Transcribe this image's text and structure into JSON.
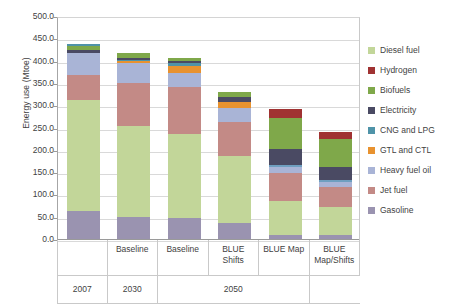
{
  "chart_data": {
    "type": "bar",
    "stacked": true,
    "title": "",
    "xlabel": "",
    "ylabel": "Energy use (Mtoe)",
    "ylim": [
      0,
      500
    ],
    "ytick_step": 50,
    "ytick_labels": [
      "500.0",
      "450.0",
      "400.0",
      "350.0",
      "300.0",
      "250.0",
      "200.0",
      "150.0",
      "100.0",
      "50.0",
      "0.0"
    ],
    "grid": true,
    "legend_position": "right",
    "categories": [
      "",
      "Baseline",
      "Baseline",
      "BLUE Shifts",
      "BLUE Map",
      "BLUE Map/Shifts"
    ],
    "category_labels_line1": [
      "",
      "Baseline",
      "Baseline",
      "BLUE",
      "BLUE Map",
      "BLUE"
    ],
    "category_labels_line2": [
      "",
      "",
      "",
      "Shifts",
      "",
      "Map/Shifts"
    ],
    "group_labels": [
      "2007",
      "2030",
      "2050"
    ],
    "group_spans": [
      1,
      1,
      3
    ],
    "series": [
      {
        "name": "Gasoline",
        "color": "#9a93b0",
        "values": [
          66.0,
          52.0,
          50.0,
          39.0,
          12.0,
          11.0
        ]
      },
      {
        "name": "Jet fuel",
        "color": "#c38a86",
        "values": [
          0.0,
          0.0,
          0.0,
          0.0,
          0.0,
          0.0
        ]
      },
      {
        "name": "Heavy fuel oil",
        "color": "#a9b4d6",
        "values": [
          0.0,
          0.0,
          0.0,
          0.0,
          0.0,
          0.0
        ]
      },
      {
        "name": "GTL and CTL",
        "color": "#e8922f",
        "values": [
          0.0,
          0.0,
          0.0,
          0.0,
          0.0,
          0.0
        ]
      },
      {
        "name": "CNG and LPG",
        "color": "#4f93a8",
        "values": [
          0.0,
          0.0,
          0.0,
          0.0,
          0.0,
          0.0
        ]
      },
      {
        "name": "Electricity",
        "color": "#4a4a63",
        "values": [
          0.0,
          0.0,
          0.0,
          0.0,
          0.0,
          0.0
        ]
      },
      {
        "name": "Biofuels",
        "color": "#7fa84a",
        "values": [
          0.0,
          0.0,
          0.0,
          0.0,
          0.0,
          0.0
        ]
      },
      {
        "name": "Hydrogen",
        "color": "#a03232",
        "values": [
          0.0,
          0.0,
          0.0,
          0.0,
          0.0,
          0.0
        ]
      },
      {
        "name": "Diesel fuel",
        "color": "#c2d699",
        "values": [
          0.0,
          0.0,
          0.0,
          0.0,
          0.0,
          0.0
        ]
      }
    ],
    "bars": [
      {
        "name": "2007",
        "total": 440.0,
        "segments": [
          {
            "series": "Gasoline",
            "value": 66.0,
            "color": "#9a93b0"
          },
          {
            "series": "Diesel fuel",
            "value": 249.0,
            "color": "#c2d699"
          },
          {
            "series": "Jet fuel",
            "value": 55.0,
            "color": "#c38a86"
          },
          {
            "series": "Heavy fuel oil",
            "value": 50.0,
            "color": "#a9b4d6"
          },
          {
            "series": "Electricity",
            "value": 7.0,
            "color": "#4a4a63"
          },
          {
            "series": "Biofuels",
            "value": 9.0,
            "color": "#7fa84a"
          },
          {
            "series": "CNG and LPG",
            "value": 4.0,
            "color": "#4f93a8"
          }
        ]
      },
      {
        "name": "2030 Baseline",
        "total": 420.0,
        "segments": [
          {
            "series": "Gasoline",
            "value": 52.0,
            "color": "#9a93b0"
          },
          {
            "series": "Diesel fuel",
            "value": 203.0,
            "color": "#c2d699"
          },
          {
            "series": "Jet fuel",
            "value": 96.0,
            "color": "#c38a86"
          },
          {
            "series": "Heavy fuel oil",
            "value": 45.0,
            "color": "#a9b4d6"
          },
          {
            "series": "GTL and CTL",
            "value": 5.0,
            "color": "#e8922f"
          },
          {
            "series": "CNG and LPG",
            "value": 3.0,
            "color": "#4f93a8"
          },
          {
            "series": "Electricity",
            "value": 4.0,
            "color": "#4a4a63"
          },
          {
            "series": "Biofuels",
            "value": 12.0,
            "color": "#7fa84a"
          }
        ]
      },
      {
        "name": "2050 Baseline",
        "total": 408.0,
        "segments": [
          {
            "series": "Gasoline",
            "value": 50.0,
            "color": "#9a93b0"
          },
          {
            "series": "Diesel fuel",
            "value": 187.0,
            "color": "#c2d699"
          },
          {
            "series": "Jet fuel",
            "value": 105.0,
            "color": "#c38a86"
          },
          {
            "series": "Heavy fuel oil",
            "value": 33.0,
            "color": "#a9b4d6"
          },
          {
            "series": "GTL and CTL",
            "value": 16.0,
            "color": "#e8922f"
          },
          {
            "series": "CNG and LPG",
            "value": 6.0,
            "color": "#4f93a8"
          },
          {
            "series": "Electricity",
            "value": 4.0,
            "color": "#4a4a63"
          },
          {
            "series": "Biofuels",
            "value": 7.0,
            "color": "#7fa84a"
          }
        ]
      },
      {
        "name": "2050 BLUE Shifts",
        "total": 333.0,
        "segments": [
          {
            "series": "Gasoline",
            "value": 39.0,
            "color": "#9a93b0"
          },
          {
            "series": "Diesel fuel",
            "value": 150.0,
            "color": "#c2d699"
          },
          {
            "series": "Jet fuel",
            "value": 75.0,
            "color": "#c38a86"
          },
          {
            "series": "Heavy fuel oil",
            "value": 33.0,
            "color": "#a9b4d6"
          },
          {
            "series": "GTL and CTL",
            "value": 13.0,
            "color": "#e8922f"
          },
          {
            "series": "Electricity",
            "value": 10.0,
            "color": "#4a4a63"
          },
          {
            "series": "Biofuels",
            "value": 13.0,
            "color": "#7fa84a"
          }
        ]
      },
      {
        "name": "2050 BLUE Map",
        "total": 293.0,
        "segments": [
          {
            "series": "Gasoline",
            "value": 12.0,
            "color": "#9a93b0"
          },
          {
            "series": "Diesel fuel",
            "value": 76.0,
            "color": "#c2d699"
          },
          {
            "series": "Jet fuel",
            "value": 62.0,
            "color": "#c38a86"
          },
          {
            "series": "Heavy fuel oil",
            "value": 13.0,
            "color": "#a9b4d6"
          },
          {
            "series": "CNG and LPG",
            "value": 6.0,
            "color": "#6f9fc0"
          },
          {
            "series": "Electricity",
            "value": 35.0,
            "color": "#4a4a63"
          },
          {
            "series": "Biofuels",
            "value": 69.0,
            "color": "#7fa84a"
          },
          {
            "series": "Hydrogen",
            "value": 20.0,
            "color": "#a03232"
          }
        ]
      },
      {
        "name": "2050 BLUE Map/Shifts",
        "total": 243.0,
        "segments": [
          {
            "series": "Gasoline",
            "value": 11.0,
            "color": "#9a93b0"
          },
          {
            "series": "Diesel fuel",
            "value": 63.0,
            "color": "#c2d699"
          },
          {
            "series": "Jet fuel",
            "value": 45.0,
            "color": "#c38a86"
          },
          {
            "series": "Heavy fuel oil",
            "value": 11.0,
            "color": "#a9b4d6"
          },
          {
            "series": "CNG and LPG",
            "value": 5.0,
            "color": "#6f9fc0"
          },
          {
            "series": "Electricity",
            "value": 28.0,
            "color": "#4a4a63"
          },
          {
            "series": "Biofuels",
            "value": 63.0,
            "color": "#7fa84a"
          },
          {
            "series": "Hydrogen",
            "value": 17.0,
            "color": "#a03232"
          }
        ]
      }
    ],
    "legend": [
      {
        "label": "Diesel fuel",
        "color": "#c2d699"
      },
      {
        "label": "Hydrogen",
        "color": "#a03232"
      },
      {
        "label": "Biofuels",
        "color": "#7fa84a"
      },
      {
        "label": "Electricity",
        "color": "#4a4a63"
      },
      {
        "label": "CNG and LPG",
        "color": "#4f93a8"
      },
      {
        "label": "GTL and CTL",
        "color": "#e8922f"
      },
      {
        "label": "Heavy fuel oil",
        "color": "#a9b4d6"
      },
      {
        "label": "Jet fuel",
        "color": "#c38a86"
      },
      {
        "label": "Gasoline",
        "color": "#9a93b0"
      }
    ]
  }
}
